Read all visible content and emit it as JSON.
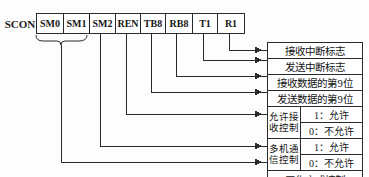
{
  "register": {
    "name": "SCON",
    "bits": [
      {
        "label": "SM0"
      },
      {
        "label": "SM1"
      },
      {
        "label": "SM2"
      },
      {
        "label": "REN"
      },
      {
        "label": "TB8"
      },
      {
        "label": "RB8"
      },
      {
        "label": "T1"
      },
      {
        "label": "R1"
      }
    ]
  },
  "descriptions": [
    {
      "text": "接收中断标志"
    },
    {
      "text": "发送中断标志"
    },
    {
      "text": "接收数据的第9位"
    },
    {
      "text": "发送数据的第9位"
    }
  ],
  "split_boxes": [
    {
      "label_line1": "允许接",
      "label_line2": "收控制",
      "value_one": "1：允许",
      "value_zero": "0：不允许"
    },
    {
      "label_line1": "多机通",
      "label_line2": "信控制",
      "value_one": "1：允许",
      "value_zero": "0：不允许"
    }
  ],
  "mode_box": {
    "text": "工作方式控制"
  },
  "colors": {
    "line": "#2a2a2a",
    "text": "#141414",
    "background": "#fdfdfd"
  }
}
